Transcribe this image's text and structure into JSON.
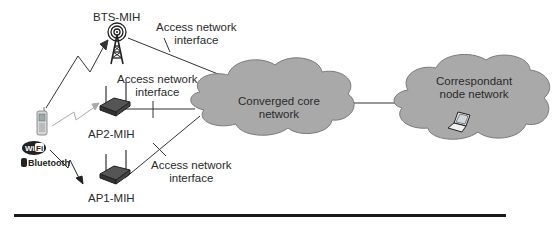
{
  "diagram": {
    "nodes": {
      "bts": {
        "label": "BTS-MIH",
        "icon": "cell-tower-icon"
      },
      "ap2": {
        "label": "AP2-MIH",
        "icon": "wireless-router-icon"
      },
      "ap1": {
        "label": "AP1-MIH",
        "icon": "wireless-router-icon"
      },
      "mobile": {
        "icon": "mobile-phone-icon"
      },
      "wifi_logo": {
        "text": "Wi Fi"
      },
      "bluetooth_logo": {
        "text": "Bluetooth"
      },
      "core": {
        "line1": "Converged core",
        "line2": "network"
      },
      "correspondent": {
        "line1": "Correspondant",
        "line2": "node network",
        "icon": "laptop-icon"
      }
    },
    "interfaces": [
      {
        "line1": "Access network",
        "line2": "interface"
      },
      {
        "line1": "Access network",
        "line2": "interface"
      },
      {
        "line1": "Access network",
        "line2": "interface"
      }
    ],
    "colors": {
      "cloud_fill": "#a9a9a9",
      "cloud_stroke": "#7a7a7a",
      "line": "#333333",
      "rule": "#1a1a1a"
    }
  }
}
